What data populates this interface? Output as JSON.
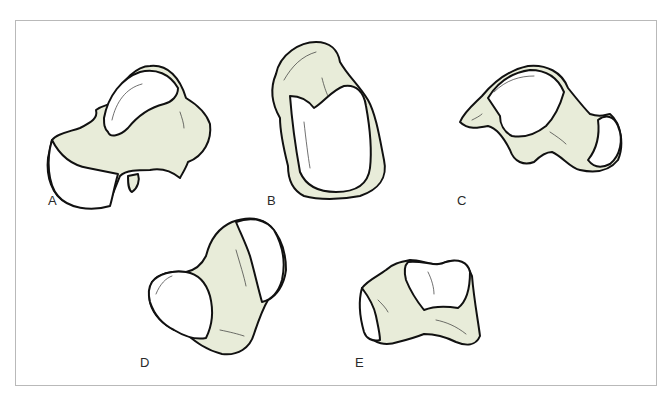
{
  "figure": {
    "panels": [
      {
        "id": "A",
        "label": "A",
        "subject": "bone-view-a"
      },
      {
        "id": "B",
        "label": "B",
        "subject": "bone-view-b"
      },
      {
        "id": "C",
        "label": "C",
        "subject": "bone-view-c"
      },
      {
        "id": "D",
        "label": "D",
        "subject": "bone-view-d"
      },
      {
        "id": "E",
        "label": "E",
        "subject": "bone-view-e"
      }
    ]
  },
  "colors": {
    "bone_fill": "#e8ecd9",
    "articular_face": "#ffffff",
    "outline": "#111111",
    "frame_border": "#b9b9b9",
    "label_text": "#2a2a2a"
  }
}
